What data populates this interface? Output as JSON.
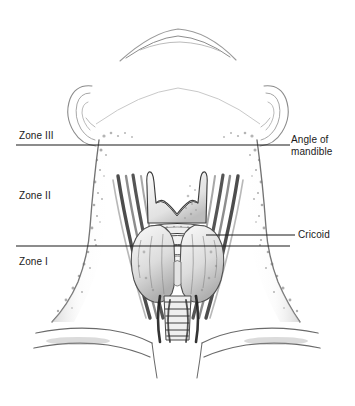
{
  "figure": {
    "background_color": "#ffffff",
    "line_color": "#1a1a1a",
    "ink_color": "#555555",
    "width": 355,
    "height": 406
  },
  "zone_labels": {
    "zone3": "Zone III",
    "zone2": "Zone II",
    "zone1": "Zone I"
  },
  "landmark_labels": {
    "mandible_line1": "Angle of",
    "mandible_line2": "mandible",
    "cricoid": "Cricoid"
  },
  "boundary_lines": [
    {
      "name": "angle-of-mandible-line",
      "y": 145,
      "x_start": 16,
      "x_end": 290
    },
    {
      "name": "cricoid-line",
      "y": 246,
      "x_start": 16,
      "x_end": 290
    }
  ],
  "leader_lines": [
    {
      "name": "mandible-leader",
      "y": 145,
      "x_start": 275,
      "x_end": 290
    },
    {
      "name": "cricoid-leader",
      "y": 235,
      "x_start": 208,
      "x_end": 295
    }
  ],
  "anatomy": [
    {
      "name": "chin-and-jaw",
      "description": "inferior border of chin and mandible, faint outline"
    },
    {
      "name": "left-ear",
      "description": "auricle at left side of head"
    },
    {
      "name": "right-ear",
      "description": "auricle at right side of head"
    },
    {
      "name": "neck-outline",
      "description": "lateral borders of the neck, stippled shading"
    },
    {
      "name": "sternocleidomastoid-left",
      "description": "dark strap muscle bands descending left"
    },
    {
      "name": "sternocleidomastoid-right",
      "description": "dark strap muscle bands descending right"
    },
    {
      "name": "thyroid-cartilage",
      "description": "laryngeal prominence with superior horns and V notch"
    },
    {
      "name": "cricoid-cartilage",
      "description": "ring below thyroid cartilage"
    },
    {
      "name": "thyroid-gland",
      "description": "bilobed gland straddling the trachea"
    },
    {
      "name": "trachea",
      "description": "tracheal rings descending to sternal notch"
    },
    {
      "name": "clavicles",
      "description": "paired clavicles and sternal notch at base"
    }
  ]
}
